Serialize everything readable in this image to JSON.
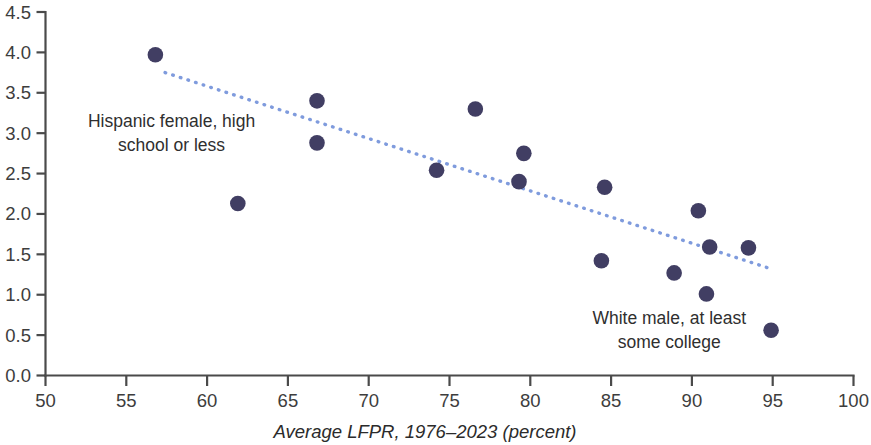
{
  "chart_data": {
    "type": "scatter",
    "title": "",
    "subtitle": "",
    "xlabel": "Average LFPR, 1976–2023 (percent)",
    "ylabel": "",
    "xlim": [
      50,
      100
    ],
    "ylim": [
      0.0,
      4.5
    ],
    "xticks": [
      50,
      55,
      60,
      65,
      70,
      75,
      80,
      85,
      90,
      95,
      100
    ],
    "xtick_labels": [
      "50",
      "55",
      "60",
      "65",
      "70",
      "75",
      "80",
      "85",
      "90",
      "95",
      "100"
    ],
    "yticks": [
      0.0,
      0.5,
      1.0,
      1.5,
      2.0,
      2.5,
      3.0,
      3.5,
      4.0,
      4.5
    ],
    "ytick_labels": [
      "0.0",
      "0.5",
      "1.0",
      "1.5",
      "2.0",
      "2.5",
      "3.0",
      "3.5",
      "4.0",
      "4.5"
    ],
    "grid": false,
    "legend": false,
    "legend_position": "none",
    "marker_color": "#413e63",
    "marker_size": 11,
    "points": [
      {
        "x": 56.8,
        "y": 3.97
      },
      {
        "x": 61.9,
        "y": 2.13
      },
      {
        "x": 66.8,
        "y": 3.4
      },
      {
        "x": 66.8,
        "y": 2.88
      },
      {
        "x": 74.2,
        "y": 2.54
      },
      {
        "x": 76.6,
        "y": 3.3
      },
      {
        "x": 79.3,
        "y": 2.4
      },
      {
        "x": 79.6,
        "y": 2.75
      },
      {
        "x": 84.4,
        "y": 1.42
      },
      {
        "x": 84.6,
        "y": 2.33
      },
      {
        "x": 88.9,
        "y": 1.27
      },
      {
        "x": 90.4,
        "y": 2.04
      },
      {
        "x": 90.9,
        "y": 1.01
      },
      {
        "x": 91.1,
        "y": 1.59
      },
      {
        "x": 93.5,
        "y": 1.58
      },
      {
        "x": 94.9,
        "y": 0.56
      }
    ],
    "trendline": {
      "type": "linear-fit",
      "style": "dotted",
      "color": "#7f9bdd",
      "x_start": 57.4,
      "y_start": 3.75,
      "x_end": 94.9,
      "y_end": 1.32
    },
    "annotations": [
      {
        "id": "hispanic-female",
        "lines": [
          "Hispanic female, high",
          "school or less"
        ],
        "x": 57.8,
        "y": 3.08,
        "points_to": {
          "x": 56.8,
          "y": 3.97
        }
      },
      {
        "id": "white-male",
        "lines": [
          "White male, at least",
          "some college"
        ],
        "x": 88.6,
        "y": 0.64,
        "points_to": {
          "x": 94.9,
          "y": 0.56
        }
      }
    ]
  }
}
